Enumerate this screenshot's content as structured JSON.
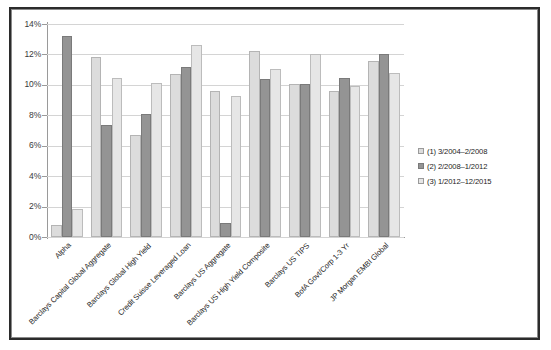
{
  "chart_data": {
    "type": "bar",
    "title": "",
    "subtitle": "",
    "xlabel": "",
    "ylabel": "",
    "ylim": [
      0,
      14
    ],
    "ytick_labels": [
      "14%",
      "12%",
      "10%",
      "8%",
      "6%",
      "4%",
      "2%",
      "0%"
    ],
    "ytick_values": [
      14,
      12,
      10,
      8,
      6,
      4,
      2,
      0
    ],
    "grid": true,
    "legend_position": "right",
    "units": "percent",
    "categories": [
      "Alpha",
      "Barclays Capital Global Aggregate",
      "Barclays Global High Yield",
      "Credit Suisse Leveraged Loan",
      "Barclays US Aggregate",
      "Barclays US High Yield Composite",
      "Barclays US TIPS",
      "BofA Govt/Corp 1-3 Yr",
      "JP Morgan EMBI Global"
    ],
    "series": [
      {
        "name": "(1) 3/2004–2/2008",
        "color": "#dcdcdc",
        "values": [
          0.8,
          11.8,
          6.7,
          10.7,
          9.6,
          12.25,
          10.05,
          9.6,
          11.55
        ]
      },
      {
        "name": "(2) 2/2008–1/2012",
        "color": "#949494",
        "values": [
          13.2,
          7.35,
          8.1,
          11.15,
          0.9,
          10.4,
          10.05,
          10.45,
          12.05
        ]
      },
      {
        "name": "(3) 1/2012–12/2015",
        "color": "#e6e6e6",
        "values": [
          1.85,
          10.45,
          10.1,
          12.6,
          9.3,
          11.05,
          12.0,
          9.9,
          10.8
        ]
      }
    ]
  },
  "legend": {
    "items": [
      {
        "label": "(1) 3/2004–2/2008"
      },
      {
        "label": "(2) 2/2008–1/2012"
      },
      {
        "label": "(3) 1/2012–12/2015"
      }
    ]
  }
}
